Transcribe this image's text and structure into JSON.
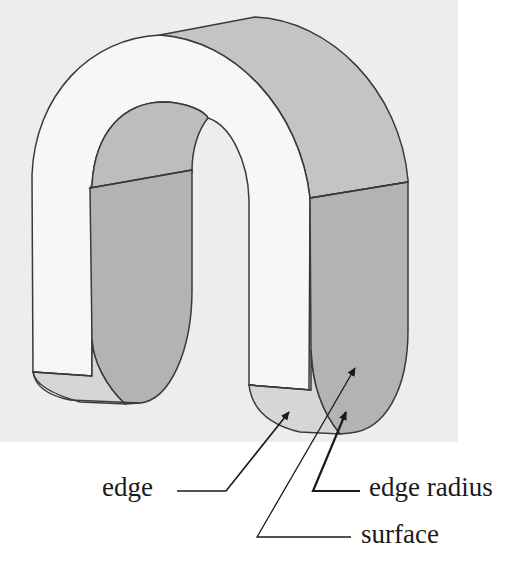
{
  "diagram": {
    "colors": {
      "background_panel": "#ededed",
      "page": "#ffffff",
      "outline": "#3a3a3a",
      "front_face": "#f6f6f6",
      "shaded_face": "#b9b9b9",
      "light_shaded_face": "#d8d8d8",
      "text": "#1a1a1a"
    },
    "labels": [
      {
        "id": "edge",
        "text": "edge"
      },
      {
        "id": "edge_radius",
        "text": "edge radius"
      },
      {
        "id": "surface",
        "text": "surface"
      }
    ]
  }
}
